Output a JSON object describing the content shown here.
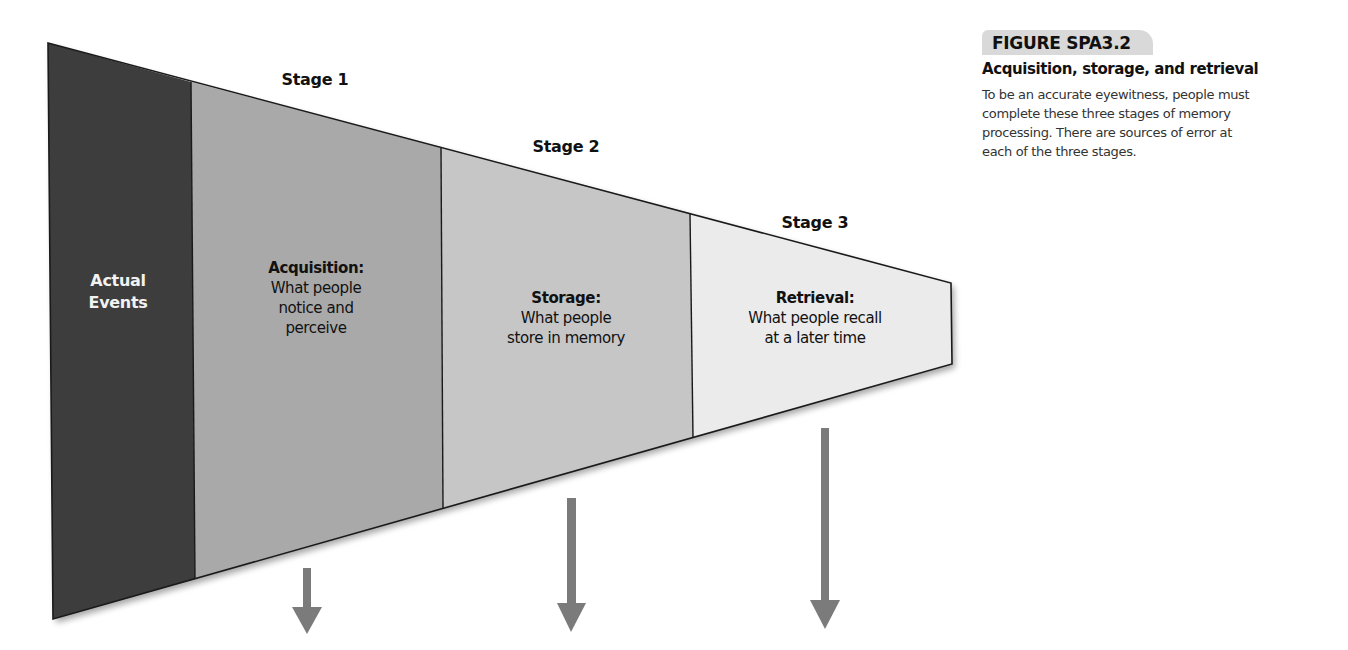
{
  "figure": {
    "number": "FIGURE SPA3.2",
    "title": "Acquisition, storage, and retrieval",
    "caption_lines": [
      "To be an accurate eyewitness, people must",
      "complete these three stages of memory",
      "processing. There are sources of error at",
      "each of the three stages."
    ]
  },
  "diagram": {
    "actual_events": {
      "lines": [
        "Actual",
        "Events"
      ],
      "color": "#3d3d3d"
    },
    "stages": [
      {
        "title": "Stage 1",
        "heading": "Acquisition:",
        "lines": [
          "What people",
          "notice and",
          "perceive"
        ],
        "color": "#a9a9a9"
      },
      {
        "title": "Stage 2",
        "heading": "Storage:",
        "lines": [
          "What people",
          "store in memory"
        ],
        "color": "#c6c6c6"
      },
      {
        "title": "Stage 3",
        "heading": "Retrieval:",
        "lines": [
          "What people recall",
          "at a later time"
        ],
        "color": "#ebebeb"
      }
    ],
    "arrow_color": "#7b7b7b",
    "arrows": [
      {
        "stage": "Stage 1",
        "label": "error-arrow-acquisition"
      },
      {
        "stage": "Stage 2",
        "label": "error-arrow-storage"
      },
      {
        "stage": "Stage 3",
        "label": "error-arrow-retrieval"
      }
    ]
  }
}
